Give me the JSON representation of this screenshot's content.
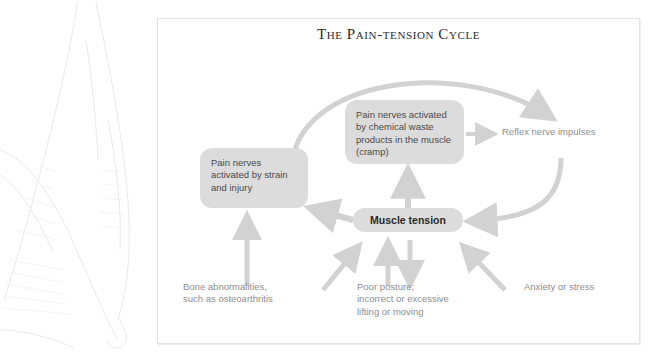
{
  "figure": {
    "title": "The Pain-tension Cycle",
    "frame_color": "#e3e3e3",
    "node_fill": "#dcdcdc",
    "arrow_color": "#d2d2d2",
    "text_color": "#8e8e8e"
  },
  "nodes": [
    {
      "id": "chemical",
      "text": "Pain nerves activated by chemical waste products in the muscle (cramp)",
      "style": "box"
    },
    {
      "id": "strain",
      "text": "Pain nerves activated by strain and injury",
      "style": "box"
    },
    {
      "id": "muscle",
      "text": "Muscle tension",
      "style": "box-bold"
    }
  ],
  "labels": [
    {
      "id": "reflex",
      "text": "Reflex nerve impulses"
    },
    {
      "id": "bone",
      "text": "Bone abnormalities,\nsuch as osteoarthritis"
    },
    {
      "id": "posture",
      "text": "Poor posture;\nincorrect or excessive\nlifting or moving"
    },
    {
      "id": "anxiety",
      "text": "Anxiety or stress"
    }
  ],
  "connections": [
    {
      "from": "strain",
      "to": "reflex",
      "kind": "large-arc-clockwise"
    },
    {
      "from": "chemical",
      "to": "reflex",
      "kind": "straight-right"
    },
    {
      "from": "muscle",
      "to": "chemical",
      "kind": "straight-up"
    },
    {
      "from": "muscle",
      "to": "strain",
      "kind": "diagonal-up-left"
    },
    {
      "from": "reflex",
      "to": "muscle",
      "kind": "curve-down-left"
    },
    {
      "from": "bone",
      "to": "strain",
      "kind": "straight-up"
    },
    {
      "from": "posture",
      "to": "muscle",
      "kind": "straight-up"
    },
    {
      "from": "muscle",
      "to": "posture",
      "kind": "straight-down"
    },
    {
      "from": "bone-area",
      "to": "muscle",
      "kind": "diagonal-up-right"
    },
    {
      "from": "anxiety",
      "to": "muscle",
      "kind": "diagonal-up-left"
    }
  ]
}
